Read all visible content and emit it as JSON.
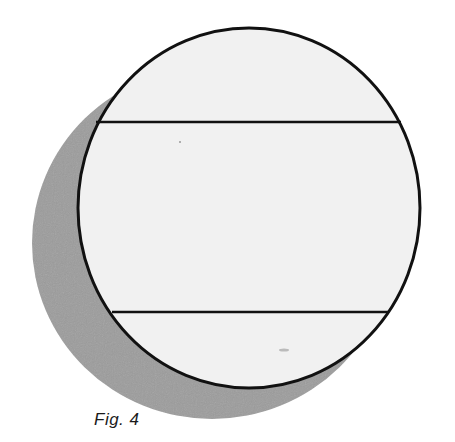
{
  "figure": {
    "caption": "Fig. 4",
    "colors": {
      "outline": "#111111",
      "disc_fill": "#f1f1f1",
      "shadow": "#9a9a9a",
      "background": "#ffffff"
    },
    "disc": {
      "cx": 249,
      "cy": 208,
      "rx": 171,
      "ry": 180
    },
    "shadow": {
      "cx": 212,
      "cy": 243,
      "rx": 180,
      "ry": 176
    },
    "chords": [
      {
        "name": "upper-chord",
        "y": 122
      },
      {
        "name": "lower-chord",
        "y": 312
      }
    ]
  }
}
